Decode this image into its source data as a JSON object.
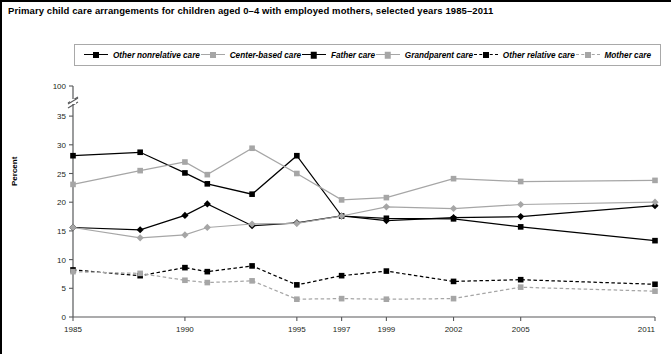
{
  "title": "Primary child care arrangements for children aged 0–4 with employed mothers, selected years 1985–2011",
  "axis": {
    "ylabel": "Percent",
    "y_ticks": [
      "0",
      "5",
      "10",
      "15",
      "20",
      "25",
      "30",
      "35",
      "100"
    ],
    "x_ticks": [
      "1985",
      "1990",
      "1995",
      "1997",
      "1999",
      "2002",
      "2005",
      "2011"
    ]
  },
  "legend": {
    "items": [
      {
        "label": "Other nonrelative care",
        "color": "#000000",
        "marker": "square",
        "dash": "solid",
        "name": "legend-item-other-nonrelative-care"
      },
      {
        "label": "Center-based care",
        "color": "#a6a6a6",
        "marker": "square",
        "dash": "solid",
        "name": "legend-item-center-based-care"
      },
      {
        "label": "Father care",
        "color": "#000000",
        "marker": "diamond",
        "dash": "solid",
        "name": "legend-item-father-care"
      },
      {
        "label": "Grandparent care",
        "color": "#a6a6a6",
        "marker": "diamond",
        "dash": "solid",
        "name": "legend-item-grandparent-care"
      },
      {
        "label": "Other relative care",
        "color": "#000000",
        "marker": "square",
        "dash": "dashed",
        "name": "legend-item-other-relative-care"
      },
      {
        "label": "Mother care",
        "color": "#a6a6a6",
        "marker": "square",
        "dash": "dashed",
        "name": "legend-item-mother-care"
      }
    ]
  },
  "chart_data": {
    "type": "line",
    "title": "Primary child care arrangements for children aged 0–4 with employed mothers, selected years 1985–2011",
    "xlabel": "",
    "ylabel": "Percent",
    "ylim": [
      0,
      37
    ],
    "y_axis_break": {
      "between": [
        35,
        100
      ],
      "top_tick": 100
    },
    "grid": false,
    "legend_position": "top",
    "x": [
      1985,
      1988,
      1990,
      1991,
      1993,
      1995,
      1997,
      1999,
      2002,
      2005,
      2011
    ],
    "x_tick_labels": [
      "1985",
      "1990",
      "1995",
      "1997",
      "1999",
      "2002",
      "2005",
      "2011"
    ],
    "series": [
      {
        "name": "Other nonrelative care",
        "color": "#000000",
        "marker": "square",
        "dash": "solid",
        "values": [
          28.1,
          28.7,
          25.1,
          23.2,
          21.4,
          28.1,
          17.6,
          17.2,
          17.1,
          15.7,
          13.3
        ]
      },
      {
        "name": "Center-based care",
        "color": "#a6a6a6",
        "marker": "square",
        "dash": "solid",
        "values": [
          23.1,
          25.5,
          27.0,
          24.8,
          29.4,
          25.0,
          20.4,
          20.8,
          24.1,
          23.6,
          23.8
        ]
      },
      {
        "name": "Father care",
        "color": "#000000",
        "marker": "diamond",
        "dash": "solid",
        "values": [
          15.6,
          15.2,
          17.7,
          19.7,
          15.9,
          16.4,
          17.6,
          16.8,
          17.3,
          17.5,
          19.4
        ]
      },
      {
        "name": "Grandparent care",
        "color": "#a6a6a6",
        "marker": "diamond",
        "dash": "solid",
        "values": [
          15.6,
          13.8,
          14.3,
          15.6,
          16.2,
          16.3,
          17.6,
          19.2,
          18.9,
          19.6,
          20.0
        ]
      },
      {
        "name": "Other relative care",
        "color": "#000000",
        "marker": "square",
        "dash": "dashed",
        "values": [
          8.2,
          7.2,
          8.6,
          7.9,
          8.9,
          5.6,
          7.2,
          8.0,
          6.2,
          6.5,
          5.7
        ]
      },
      {
        "name": "Mother care",
        "color": "#a6a6a6",
        "marker": "square",
        "dash": "dashed",
        "values": [
          7.9,
          7.6,
          6.4,
          6.0,
          6.3,
          3.1,
          3.2,
          3.1,
          3.2,
          5.2,
          4.5
        ]
      }
    ]
  }
}
